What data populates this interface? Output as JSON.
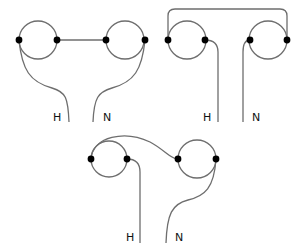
{
  "diagrams": [
    {
      "id": "series-bridge",
      "labels": {
        "hot": "H",
        "neutral": "N"
      }
    },
    {
      "id": "top-bridge",
      "labels": {
        "hot": "H",
        "neutral": "N"
      }
    },
    {
      "id": "crossover",
      "labels": {
        "hot": "H",
        "neutral": "N"
      }
    }
  ],
  "colors": {
    "wire": "#6e6e6e",
    "terminal": "#000000",
    "text": "#111111",
    "background": "#ffffff"
  }
}
